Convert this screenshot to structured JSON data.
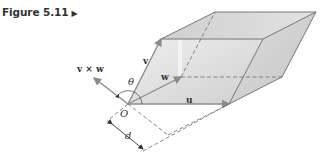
{
  "caption": {
    "label": "Figure 5.11",
    "marker": "▶"
  },
  "diagram": {
    "labels": {
      "cross": "v × w",
      "v": "v",
      "w": "w",
      "u": "u",
      "theta": "θ",
      "origin": "O",
      "distance": "d"
    },
    "colors": {
      "edge": "#6a6a6a",
      "vector": "#8c8c8c",
      "face_light": "#e6e6e6",
      "face_mid": "#d2d2d2",
      "face_dark": "#bdbdbd",
      "dashed": "#777777"
    }
  }
}
